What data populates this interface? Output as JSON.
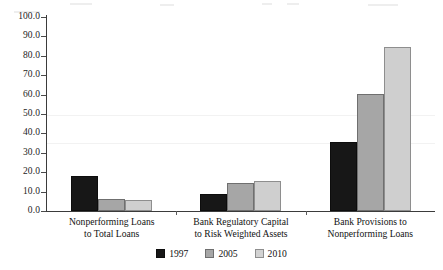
{
  "chart_data": {
    "type": "bar",
    "title": "",
    "subtitle": "",
    "xlabel": "",
    "ylabel": "",
    "ylim": [
      0.0,
      100.0
    ],
    "ytick_step": 10.0,
    "yticks": [
      "100.0",
      "90.0",
      "80.0",
      "70.0",
      "60.0",
      "50.0",
      "40.0",
      "30.0",
      "20.0",
      "10.0",
      "0.0"
    ],
    "grid": false,
    "legend_position": "bottom-center",
    "categories": [
      "Nonperforming Loans to Total Loans",
      "Bank Regulatory Capital to Risk Weighted Assets",
      "Bank Provisions to Nonperforming Loans"
    ],
    "category_lines": [
      [
        "Nonperforming Loans",
        "to Total Loans"
      ],
      [
        "Bank Regulatory Capital",
        "to Risk Weighted Assets"
      ],
      [
        "Bank Provisions to",
        "Nonperforming Loans"
      ]
    ],
    "series": [
      {
        "name": "1997",
        "color": "#171717",
        "values": [
          18.0,
          8.8,
          35.6
        ]
      },
      {
        "name": "2005",
        "color": "#a6a6a6",
        "values": [
          6.2,
          14.5,
          60.3
        ]
      },
      {
        "name": "2010",
        "color": "#cfcfcf",
        "values": [
          5.7,
          15.7,
          84.5
        ]
      }
    ]
  },
  "legend": {
    "items": [
      {
        "label": "1997",
        "swatch": "legend-swatch-1997"
      },
      {
        "label": "2005",
        "swatch": "legend-swatch-2005"
      },
      {
        "label": "2010",
        "swatch": "legend-swatch-2010"
      }
    ]
  },
  "axis": {
    "y_tick_labels": [
      "100.0",
      "90.0",
      "80.0",
      "70.0",
      "60.0",
      "50.0",
      "40.0",
      "30.0",
      "20.0",
      "10.0",
      "0.0"
    ]
  }
}
